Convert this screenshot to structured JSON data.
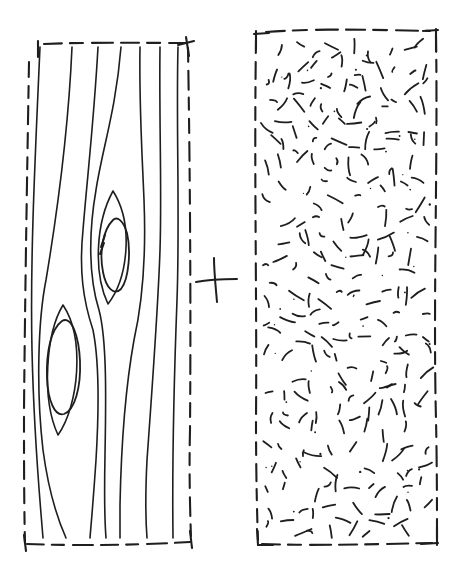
{
  "figure": {
    "background": "#ffffff",
    "ink_color": "#1e1e1e",
    "operator": {
      "symbol": "+",
      "stroke_width": 2,
      "strokes": [
        "M 196,282 C 206,280 222,279 237,279",
        "M 214,258 C 214,272 216,290 217,302"
      ]
    },
    "left_panel": {
      "id": "grain-panel",
      "description": "dashed hand-drawn rectangle filled with smooth vertical grain lines flowing around two oval voids",
      "border_width": 2.1,
      "line_width": 1.6,
      "border": [
        {
          "d": "M 44,44 C 90,42 140,43 186,43",
          "dash": "18 8 13 9 21 8"
        },
        {
          "d": "M 188,48 C 190,170 191,300 190,430 C 189,470 190,508 191,538",
          "dash": "14 9 19 8 12 9"
        },
        {
          "d": "M 27,544 C 80,546 140,545 190,542",
          "dash": "17 8 12 9 20 8"
        },
        {
          "d": "M 29,62 C 27,180 25,300 24,410 C 24,455 24,505 25,543",
          "dash": "15 9 12 8 18 9"
        }
      ],
      "corner_ticks": [
        "M 38,41 L 38,57",
        "M 186,37 L 189,56",
        "M 178,45 L 194,41",
        "M 24,535 L 26,551",
        "M 190,531 L 192,548"
      ],
      "flow_lines": [
        "M 40,47 C 35,160 30,260 32,350 C 34,440 40,500 43,538",
        "M 72,47 C 68,140 56,220 46,280 C 38,320 36,390 43,450 C 49,495 58,520 66,538",
        "M 98,47 C 94,120 87,180 83,230 C 79,270 83,300 93,330 C 99,360 99,410 96,460 C 93,505 91,525 90,538",
        "M 121,47 C 116,110 102,150 96,190 C 89,230 88,275 99,310 C 107,340 106,400 105,455 C 104,505 105,525 106,538",
        "M 140,47 C 139,105 142,150 144,200 C 146,250 143,300 134,340 C 125,390 121,455 120,505 C 120,520 120,530 120,538",
        "M 160,47 C 159,120 162,190 160,250 C 158,310 152,390 147,460 C 145,500 146,525 147,538",
        "M 178,47 C 176,120 180,220 177,300 C 174,380 172,460 173,538"
      ],
      "defect_eyes": [
        "M 113,191 C 96,222 93,272 108,304 C 128,278 134,224 113,191",
        "M 63,305 C 46,333 41,398 58,435 C 79,405 85,338 63,305"
      ],
      "defect_ovals": [
        "M 113,220 C 103,230 99,252 103,272 C 106,288 114,296 121,289 C 129,279 131,250 127,233 C 123,220 117,216 113,220 Z",
        "M 62,321 C 51,329 46,352 47,378 C 48,401 55,417 64,414 C 75,410 81,387 80,361 C 79,338 72,315 62,321 Z"
      ],
      "retrace_marks": [
        "M 105,235 L 101,247",
        "M 104,243 L 100,254"
      ]
    },
    "right_panel": {
      "id": "random-dash-panel",
      "description": "dashed hand-drawn rectangle filled with short randomly oriented pen dashes and ink specks",
      "border_width": 2.1,
      "border": [
        {
          "d": "M 266,32 C 320,28 380,30 430,31",
          "dash": "19 8 14 9 22 8"
        },
        {
          "d": "M 436,36 C 438,160 433,300 436,420 C 437,465 437,510 437,540",
          "dash": "16 8 12 9 20 8"
        },
        {
          "d": "M 262,544 C 320,546 380,544 432,543",
          "dash": "18 8 13 9 21 8"
        },
        {
          "d": "M 256,40 C 254,170 257,300 256,420 C 256,470 257,515 258,540",
          "dash": "13 9 17 8 11 9"
        }
      ],
      "corner_ticks": [
        "M 256,31 L 256,49",
        "M 254,34 L 269,33",
        "M 436,29 L 436,51",
        "M 423,31 L 438,30",
        "M 257,529 L 258,545",
        "M 258,545 L 273,545",
        "M 437,527 L 437,545",
        "M 421,544 L 438,543"
      ],
      "texture": {
        "seed": 11,
        "x0": 264,
        "y0": 40,
        "x1": 430,
        "y1": 536,
        "cols": 12,
        "rows": 26,
        "dash_prob": 0.8,
        "dot_prob": 0.14,
        "min_len": 5,
        "max_len": 18,
        "curve": 2.5,
        "stroke_width": 1.8,
        "dot_min_r": 0.6,
        "dot_max_r": 1.2
      }
    }
  }
}
